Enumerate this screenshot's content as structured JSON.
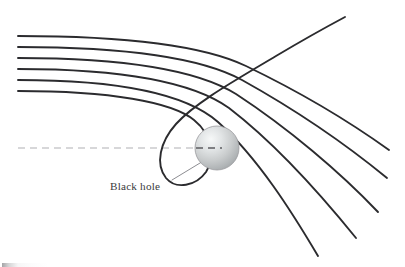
{
  "figure": {
    "background_color": "#ffffff",
    "width": 405,
    "height": 267
  },
  "labels": {
    "black_hole": "Black hole"
  },
  "colors": {
    "ray_stroke": "#2b2b2e",
    "axis_dash": "#b0b0b4",
    "axis_dash_inner": "#5c5c60",
    "leader_line": "#8d8d92",
    "sphere_light": "#f2f4f5",
    "sphere_mid": "#c6c9ca",
    "sphere_dark": "#a3a7a9",
    "sphere_outline": "#9a9a9e",
    "text": "#3a3a3d"
  },
  "chart_data": {
    "type": "line",
    "xlabel": "",
    "ylabel": "",
    "xlim": [
      0,
      405
    ],
    "ylim": [
      0,
      267
    ],
    "grid": false,
    "legend": false,
    "annotations": [
      {
        "text": "Black hole",
        "x": 110,
        "y": 186,
        "leader_from": [
          172,
          180
        ],
        "leader_to": [
          205,
          160
        ]
      }
    ],
    "black_hole": {
      "center_x": 217,
      "center_y": 148,
      "sphere_radius": 22,
      "photon_ring_radius": 33
    },
    "optic_axis": {
      "y": 148,
      "x_start": 18,
      "x_end": 196,
      "style": "dashed"
    },
    "series": [
      {
        "name": "ray-1-outermost",
        "impact_parameter": 110,
        "entry_y": 36,
        "exit_angle_deg": 22,
        "path": "M 18,36 C 120,36 200,44 246,66 C 300,92 350,122 389,150"
      },
      {
        "name": "ray-2",
        "impact_parameter": 98,
        "entry_y": 47,
        "exit_angle_deg": 28,
        "path": "M 18,47 C 120,47 198,56 242,80 C 296,110 348,146 387,178"
      },
      {
        "name": "ray-3",
        "impact_parameter": 85,
        "entry_y": 58,
        "exit_angle_deg": 35,
        "path": "M 18,58 C 118,58 194,68 236,94 C 288,128 340,172 378,212"
      },
      {
        "name": "ray-4",
        "impact_parameter": 72,
        "entry_y": 69,
        "exit_angle_deg": 45,
        "path": "M 18,69 C 116,69 190,80 229,108 C 276,144 322,196 356,238"
      },
      {
        "name": "ray-5",
        "impact_parameter": 60,
        "entry_y": 80,
        "exit_angle_deg": 58,
        "path": "M 18,80 C 114,80 184,92 218,122 C 258,158 292,212 318,256"
      },
      {
        "name": "ray-6-innermost-loops",
        "impact_parameter": 45,
        "entry_y": 91,
        "exit_angle_deg": -40,
        "loops_around": true,
        "path": "M 18,91 C 110,91 172,102 194,120 C 214,136 214,160 206,172 C 196,186 176,190 166,178 C 155,164 160,142 176,124 C 196,102 236,80 276,56 C 308,37 330,25 345,17"
      }
    ]
  }
}
